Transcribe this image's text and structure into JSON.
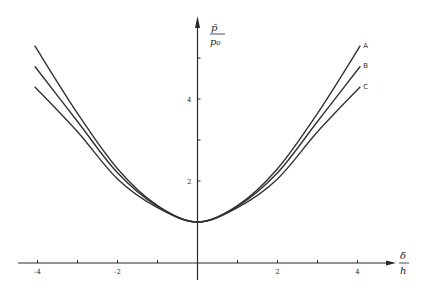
{
  "chart_data": {
    "type": "line",
    "title": "",
    "xlabel": "δ/h",
    "ylabel": "p̄/p₀",
    "xlabel_parts": {
      "numerator": "δ",
      "denominator": "h"
    },
    "ylabel_parts": {
      "numerator": "p̄",
      "denominator": "p₀"
    },
    "xlim": [
      -4.4,
      4.9
    ],
    "ylim": [
      0,
      6.0
    ],
    "x_ticks": [
      -4,
      -3,
      -2,
      -1,
      0,
      1,
      2,
      3,
      4
    ],
    "x_tick_labels": [
      {
        "value": -4,
        "label": "-4"
      },
      {
        "value": -2,
        "label": "-2"
      },
      {
        "value": 2,
        "label": "2"
      },
      {
        "value": 4,
        "label": "4"
      }
    ],
    "y_ticks": [
      2,
      3,
      4,
      5
    ],
    "y_tick_labels": [
      {
        "value": 2,
        "label": "2"
      },
      {
        "value": 4,
        "label": "4"
      }
    ],
    "grid": false,
    "legend": "inline labels at right end of curves",
    "x": [
      -4.07,
      -3,
      -2,
      -1,
      0,
      1,
      2,
      3,
      4.07
    ],
    "series": [
      {
        "name": "A",
        "values": [
          5.3,
          3.65,
          2.3,
          1.4,
          1.0,
          1.4,
          2.3,
          3.65,
          5.3
        ]
      },
      {
        "name": "B",
        "values": [
          4.8,
          3.45,
          2.2,
          1.38,
          1.0,
          1.38,
          2.2,
          3.45,
          4.8
        ]
      },
      {
        "name": "C",
        "values": [
          4.3,
          3.2,
          2.05,
          1.35,
          1.0,
          1.35,
          2.05,
          3.2,
          4.3
        ]
      }
    ]
  }
}
